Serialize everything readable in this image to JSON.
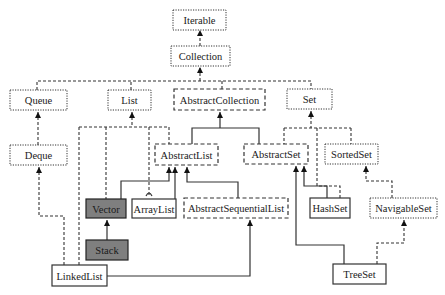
{
  "diagram": {
    "legend_styles": {
      "dotted": "interface",
      "dashed": "abstract class",
      "solid": "concrete class",
      "filled": "legacy class",
      "fill_color": "#7f7f7f"
    },
    "nodes": [
      {
        "id": "iterable",
        "label": "Iterable",
        "style": "dotted",
        "x": 173,
        "y": 10,
        "w": 53,
        "h": 20
      },
      {
        "id": "collection",
        "label": "Collection",
        "style": "dotted",
        "x": 171,
        "y": 46,
        "w": 59,
        "h": 20
      },
      {
        "id": "queue",
        "label": "Queue",
        "style": "dotted",
        "x": 10,
        "y": 90,
        "w": 57,
        "h": 20
      },
      {
        "id": "list",
        "label": "List",
        "style": "dotted",
        "x": 108,
        "y": 90,
        "w": 43,
        "h": 20
      },
      {
        "id": "abstractcollection",
        "label": "AbstractCollection",
        "style": "dashed",
        "x": 174,
        "y": 89,
        "w": 91,
        "h": 21
      },
      {
        "id": "set",
        "label": "Set",
        "style": "dotted",
        "x": 287,
        "y": 89,
        "w": 45,
        "h": 20
      },
      {
        "id": "deque",
        "label": "Deque",
        "style": "dotted",
        "x": 10,
        "y": 145,
        "w": 57,
        "h": 20
      },
      {
        "id": "abstractlist",
        "label": "AbstractList",
        "style": "dashed",
        "x": 155,
        "y": 144,
        "w": 63,
        "h": 21
      },
      {
        "id": "abstractset",
        "label": "AbstractSet",
        "style": "dashed",
        "x": 244,
        "y": 144,
        "w": 64,
        "h": 20
      },
      {
        "id": "sortedset",
        "label": "SortedSet",
        "style": "dotted",
        "x": 325,
        "y": 144,
        "w": 53,
        "h": 20
      },
      {
        "id": "vector",
        "label": "Vector",
        "style": "filled",
        "x": 86,
        "y": 199,
        "w": 40,
        "h": 19
      },
      {
        "id": "arraylist",
        "label": "ArrayList",
        "style": "solid",
        "x": 132,
        "y": 199,
        "w": 44,
        "h": 19
      },
      {
        "id": "abstractsequentiallist",
        "label": "AbstractSequentialList",
        "style": "dashed",
        "x": 184,
        "y": 198,
        "w": 104,
        "h": 20
      },
      {
        "id": "hashset",
        "label": "HashSet",
        "style": "solid",
        "x": 310,
        "y": 198,
        "w": 40,
        "h": 20
      },
      {
        "id": "navigableset",
        "label": "NavigableSet",
        "style": "dotted",
        "x": 370,
        "y": 198,
        "w": 67,
        "h": 20
      },
      {
        "id": "stack",
        "label": "Stack",
        "style": "filled",
        "x": 86,
        "y": 240,
        "w": 42,
        "h": 20
      },
      {
        "id": "linkedlist",
        "label": "LinkedList",
        "style": "solid",
        "x": 52,
        "y": 265,
        "w": 55,
        "h": 21
      },
      {
        "id": "treeset",
        "label": "TreeSet",
        "style": "solid",
        "x": 333,
        "y": 264,
        "w": 53,
        "h": 20
      }
    ],
    "edges": [
      {
        "from": "collection",
        "to": "iterable",
        "type": "dashed"
      },
      {
        "from": "queue",
        "to": "collection",
        "type": "dashed"
      },
      {
        "from": "list",
        "to": "collection",
        "type": "dashed"
      },
      {
        "from": "abstractcollection",
        "to": "collection",
        "type": "dashed"
      },
      {
        "from": "set",
        "to": "collection",
        "type": "dashed"
      },
      {
        "from": "deque",
        "to": "queue",
        "type": "dashed"
      },
      {
        "from": "abstractlist",
        "to": "abstractcollection",
        "type": "solid"
      },
      {
        "from": "abstractset",
        "to": "abstractcollection",
        "type": "solid"
      },
      {
        "from": "vector",
        "to": "list",
        "type": "dashed"
      },
      {
        "from": "arraylist",
        "to": "list",
        "type": "dashed"
      },
      {
        "from": "linkedlist",
        "to": "list",
        "type": "dashed"
      },
      {
        "from": "abstractlist",
        "to": "list",
        "type": "dashed"
      },
      {
        "from": "abstractset",
        "to": "set",
        "type": "dashed"
      },
      {
        "from": "hashset",
        "to": "set",
        "type": "dashed"
      },
      {
        "from": "sortedset",
        "to": "set",
        "type": "dashed"
      },
      {
        "from": "vector",
        "to": "abstractlist",
        "type": "solid"
      },
      {
        "from": "arraylist",
        "to": "abstractlist",
        "type": "solid"
      },
      {
        "from": "abstractsequentiallist",
        "to": "abstractlist",
        "type": "solid"
      },
      {
        "from": "hashset",
        "to": "abstractset",
        "type": "solid"
      },
      {
        "from": "treeset",
        "to": "abstractset",
        "type": "solid"
      },
      {
        "from": "navigableset",
        "to": "sortedset",
        "type": "dashed"
      },
      {
        "from": "stack",
        "to": "vector",
        "type": "solid"
      },
      {
        "from": "linkedlist",
        "to": "deque",
        "type": "dashed"
      },
      {
        "from": "linkedlist",
        "to": "abstractsequentiallist",
        "type": "solid"
      },
      {
        "from": "treeset",
        "to": "navigableset",
        "type": "dashed"
      }
    ]
  }
}
